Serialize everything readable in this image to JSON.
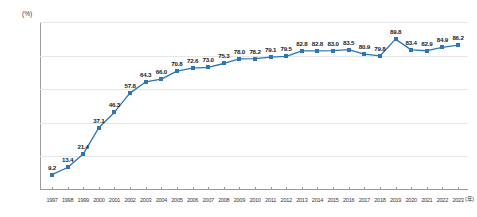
{
  "chart_data": {
    "type": "line",
    "title": "",
    "subtitle": "",
    "xlabel": "年",
    "ylabel": "(%)",
    "unit_label": "(%)",
    "xaxis_unit": "(年)",
    "grid": true,
    "legend": "none",
    "ylim": [
      0,
      100
    ],
    "ytick_labels": [
      "0",
      "20",
      "40",
      "60",
      "80",
      "100"
    ],
    "ytick_values": [
      0,
      20,
      40,
      60,
      80,
      100
    ],
    "categories": [
      "1997",
      "1998",
      "1999",
      "2000",
      "2001",
      "2002",
      "2003",
      "2004",
      "2005",
      "2006",
      "2007",
      "2008",
      "2009",
      "2010",
      "2011",
      "2012",
      "2013",
      "2014",
      "2015",
      "2016",
      "2017",
      "2018",
      "2019",
      "2020",
      "2021",
      "2022",
      "2023"
    ],
    "values": [
      9.2,
      13.4,
      21.4,
      37.1,
      46.3,
      57.8,
      64.3,
      66.0,
      70.8,
      72.6,
      73.0,
      75.3,
      78.0,
      78.2,
      79.1,
      79.5,
      82.8,
      82.8,
      83.0,
      83.5,
      80.9,
      79.8,
      89.8,
      83.4,
      82.9,
      84.9,
      86.2
    ],
    "data_labels": [
      "9.2",
      "13.4",
      "21.4",
      "37.1",
      "46.3",
      "57.8",
      "64.3",
      "66.0",
      "70.8",
      "72.6",
      "73.0",
      "75.3",
      "78.0",
      "78.2",
      "79.1",
      "79.5",
      "82.8",
      "82.8",
      "83.0",
      "83.5",
      "80.9",
      "79.8",
      "89.8",
      "83.4",
      "82.9",
      "84.9",
      "86.2"
    ],
    "series_color": "#2e75b6",
    "grid_color": "#e4e6e8",
    "axis_color": "#9a9a9a"
  }
}
